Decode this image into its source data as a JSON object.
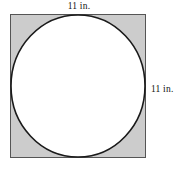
{
  "figure": {
    "colors": {
      "square_fill": "#cccccc",
      "square_stroke": "#555555",
      "circle_fill": "#ffffff",
      "circle_stroke": "#1a1a1a",
      "background": "#ffffff",
      "label_text": "#111111"
    },
    "square": {
      "x": 10.5,
      "y": 14.5,
      "width": 135,
      "height": 143,
      "stroke_width": 1.2
    },
    "circle": {
      "cx": 78,
      "cy": 86,
      "rx": 67,
      "ry": 71,
      "stroke_width": 1.6
    },
    "labels": {
      "top": {
        "text": "11 in.",
        "side": "top",
        "value": 11,
        "unit": "in."
      },
      "right": {
        "text": "11 in.",
        "side": "right",
        "value": 11,
        "unit": "in."
      }
    }
  }
}
